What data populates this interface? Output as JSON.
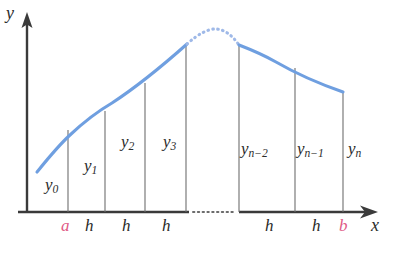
{
  "figure": {
    "kind": "trapezoidal-rule-diagram",
    "axes": {
      "y_label": "y",
      "x_label": "x",
      "axis_color": "#3a3a3a",
      "origin_px": [
        27,
        212
      ]
    },
    "curve": {
      "color": "#6f9fe0",
      "dotted_color": "#9fb9e8",
      "solid_left_points": "37,172 52,152 70,135 90,120 112,104 135,88 160,70 187,44",
      "solid_right_points": "238,44 262,52 285,66 310,78 343,92",
      "dotted_points": "187,44 196,38 205,33 214,30 223,30 232,35 238,44"
    },
    "colors": {
      "accent_pink": "#e05a86",
      "curve_blue": "#6f9fe0",
      "ink": "#2b2b2b"
    },
    "ordinate_lines": [
      {
        "name": "y0",
        "x": 68,
        "top": 130
      },
      {
        "name": "y1",
        "x": 105,
        "top": 111
      },
      {
        "name": "y2",
        "x": 145,
        "top": 83
      },
      {
        "name": "y3",
        "x": 186,
        "top": 45
      },
      {
        "name": "yn2",
        "x": 239,
        "top": 45
      },
      {
        "name": "yn1",
        "x": 295,
        "top": 68
      },
      {
        "name": "yn",
        "x": 343,
        "top": 92
      }
    ],
    "ordinate_labels": [
      {
        "text": "y",
        "sub": "0",
        "x": 45,
        "y": 183
      },
      {
        "text": "y",
        "sub": "1",
        "x": 84,
        "y": 164
      },
      {
        "text": "y",
        "sub": "2",
        "x": 121,
        "y": 140
      },
      {
        "text": "y",
        "sub": "3",
        "x": 163,
        "y": 140
      },
      {
        "text": "y",
        "sub": "n−2",
        "x": 240,
        "y": 148
      },
      {
        "text": "y",
        "sub": "n−1",
        "x": 296,
        "y": 148
      },
      {
        "text": "y",
        "sub": "n",
        "x": 347,
        "y": 148
      }
    ],
    "step_labels": [
      {
        "text": "h",
        "x": 85,
        "y": 225
      },
      {
        "text": "h",
        "x": 122,
        "y": 225
      },
      {
        "text": "h",
        "x": 162,
        "y": 225
      },
      {
        "text": "h",
        "x": 265,
        "y": 225
      },
      {
        "text": "h",
        "x": 312,
        "y": 225
      }
    ],
    "endpoints": [
      {
        "text": "a",
        "x": 61,
        "y": 225
      },
      {
        "text": "b",
        "x": 339,
        "y": 225
      }
    ],
    "axis_labels": {
      "y": {
        "text": "y",
        "x": 6,
        "y": 6
      },
      "x": {
        "text": "x",
        "x": 371,
        "y": 219
      }
    },
    "ellipsis": {
      "axis_gap_from_x": 189,
      "axis_gap_to_x": 237,
      "axis_y": 212
    }
  }
}
